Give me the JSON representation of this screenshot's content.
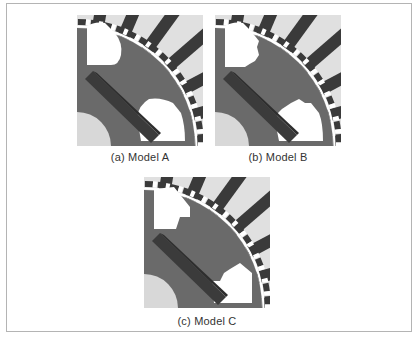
{
  "figure": {
    "panels": [
      {
        "id": "a",
        "caption": "(a) Model A",
        "pocket_style": "rounded"
      },
      {
        "id": "b",
        "caption": "(b) Model B",
        "pocket_style": "notched"
      },
      {
        "id": "c",
        "caption": "(c) Model C",
        "pocket_style": "chamfered"
      }
    ],
    "colors": {
      "stator_slot": "#e0e0e0",
      "stator_tooth": "#3a3a3a",
      "rotor_core": "#6a6a6a",
      "magnet": "#3b3b3b",
      "shaft": "#d8d8d8",
      "air_pocket": "#ffffff",
      "frame_border": "#b4b4b4"
    }
  }
}
